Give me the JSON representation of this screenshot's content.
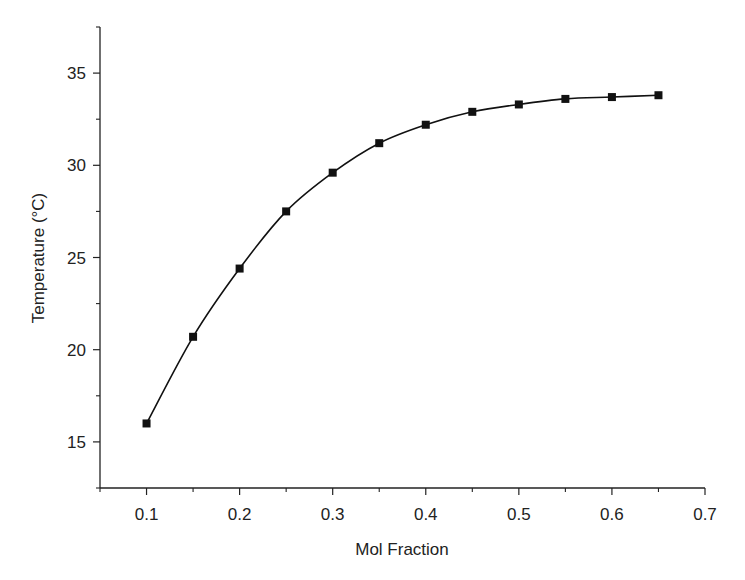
{
  "chart_data": {
    "type": "line",
    "title": "",
    "xlabel": "Mol Fraction",
    "ylabel": "Temperature (°C)",
    "xlim": [
      0.05,
      0.7
    ],
    "ylim": [
      12.5,
      37.5
    ],
    "x_ticks": [
      0.1,
      0.2,
      0.3,
      0.4,
      0.5,
      0.6,
      0.7
    ],
    "x_tick_labels": [
      "0.1",
      "0.2",
      "0.3",
      "0.4",
      "0.5",
      "0.6",
      "0.7"
    ],
    "x_minor_ticks": [
      0.15,
      0.25,
      0.35,
      0.45,
      0.55,
      0.65
    ],
    "y_ticks": [
      15,
      20,
      25,
      30,
      35
    ],
    "y_tick_labels": [
      "15",
      "20",
      "25",
      "30",
      "35"
    ],
    "y_minor_ticks": [
      12.5,
      17.5,
      22.5,
      27.5,
      32.5,
      37.5
    ],
    "grid": false,
    "legend": null,
    "marker": "square",
    "line_style": "smooth",
    "color": "#111111",
    "series": [
      {
        "name": "Temperature",
        "x": [
          0.1,
          0.15,
          0.2,
          0.25,
          0.3,
          0.35,
          0.4,
          0.45,
          0.5,
          0.55,
          0.6,
          0.65
        ],
        "values": [
          16.0,
          20.7,
          24.4,
          27.5,
          29.6,
          31.2,
          32.2,
          32.9,
          33.3,
          33.6,
          33.7,
          33.8
        ]
      }
    ]
  }
}
